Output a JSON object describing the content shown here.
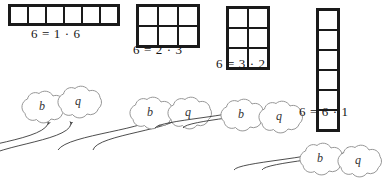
{
  "figure": {
    "ink_color": "#1a1a1a",
    "cloud_color": "#808080",
    "arrow_color": "#3a3a3a",
    "groups": [
      {
        "id": "factorization-1-times-6",
        "equation": "6 = 1 · 6",
        "rows": 1,
        "cols": 6,
        "cell": 18,
        "grid_x": 8,
        "grid_y": 4,
        "eq_x": 31,
        "eq_y": 26,
        "clouds_x": 14,
        "clouds_y": 86,
        "cloud_b": "b",
        "cloud_q": "q",
        "arrow_b": "M 34 38 C 26 56, 22 60, 12 76",
        "arrow_q": "M 57 38 C 54 56, 52 60, 48 76"
      },
      {
        "id": "factorization-2-times-3",
        "equation": "6 = 2 · 3",
        "rows": 2,
        "cols": 3,
        "cell": 20,
        "grid_x": 136,
        "grid_y": 4,
        "eq_x": 133,
        "eq_y": 42,
        "clouds_x": 122,
        "clouds_y": 92,
        "cloud_b": "b",
        "cloud_q": "q",
        "arrow_b": "M 38 22 C 30 38, 26 42, 16 58",
        "arrow_q": "M 60 22 C 57 38, 55 42, 51 58"
      },
      {
        "id": "factorization-3-times-2",
        "equation": "6 = 3 · 2",
        "rows": 3,
        "cols": 2,
        "cell": 20,
        "grid_x": 226,
        "grid_y": 6,
        "eq_x": 216,
        "eq_y": 56,
        "clouds_x": 213,
        "clouds_y": 94,
        "cloud_b": "b",
        "cloud_q": "q",
        "arrow_b": "M 32 14 C 28 22, 26 26, 22 34",
        "arrow_q": "M 56 14 C 54 22, 53 26, 50 34"
      },
      {
        "id": "factorization-6-times-1",
        "equation": "6 = 6 · 1",
        "rows": 6,
        "cols": 1,
        "cell": 20,
        "grid_x": 316,
        "grid_y": 8,
        "eq_x": 299,
        "eq_y": 104,
        "clouds_x": 292,
        "clouds_y": 138,
        "cloud_b": "b",
        "cloud_q": "q",
        "arrow_b": "M 32 12 C 28 20, 26 24, 22 32",
        "arrow_q": "M 56 12 C 54 20, 53 24, 50 32"
      }
    ]
  }
}
